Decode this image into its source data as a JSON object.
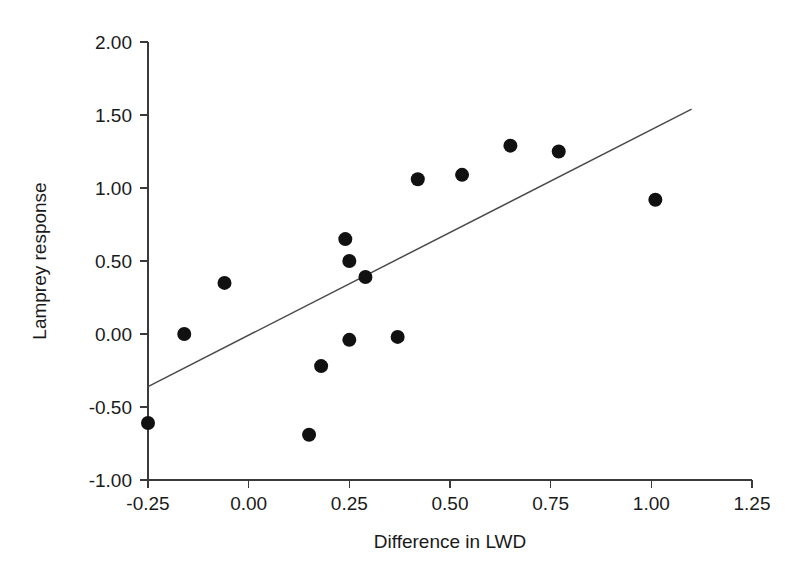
{
  "chart_data": {
    "type": "scatter",
    "title": "",
    "xlabel": "Difference in LWD",
    "ylabel": "Lamprey response",
    "xlim": [
      -0.25,
      1.25
    ],
    "ylim": [
      -1.0,
      2.0
    ],
    "grid": false,
    "legend": "none",
    "xticks": [
      -0.25,
      0.0,
      0.25,
      0.5,
      0.75,
      1.0,
      1.25
    ],
    "xtick_labels": [
      "-0.25",
      "0.00",
      "0.25",
      "0.50",
      "0.75",
      "1.00",
      "1.25"
    ],
    "yticks": [
      -1.0,
      -0.5,
      0.0,
      0.5,
      1.0,
      1.5,
      2.0
    ],
    "ytick_labels": [
      "-1.00",
      "-0.50",
      "0.00",
      "0.50",
      "1.00",
      "1.50",
      "2.00"
    ],
    "marker": {
      "shape": "circle",
      "color": "#111111",
      "size": 9
    },
    "points": [
      {
        "x": -0.25,
        "y": -0.61
      },
      {
        "x": -0.16,
        "y": 0.0
      },
      {
        "x": -0.06,
        "y": 0.35
      },
      {
        "x": 0.15,
        "y": -0.69
      },
      {
        "x": 0.18,
        "y": -0.22
      },
      {
        "x": 0.24,
        "y": 0.65
      },
      {
        "x": 0.25,
        "y": -0.04
      },
      {
        "x": 0.25,
        "y": 0.5
      },
      {
        "x": 0.29,
        "y": 0.39
      },
      {
        "x": 0.37,
        "y": -0.02
      },
      {
        "x": 0.42,
        "y": 1.06
      },
      {
        "x": 0.53,
        "y": 1.09
      },
      {
        "x": 0.65,
        "y": 1.29
      },
      {
        "x": 0.77,
        "y": 1.25
      },
      {
        "x": 1.01,
        "y": 0.92
      }
    ],
    "fit_line": {
      "type": "linear-regression",
      "x_start": -0.25,
      "y_start": -0.36,
      "x_end": 1.1,
      "y_end": 1.54,
      "color": "#4a4a4a"
    }
  }
}
